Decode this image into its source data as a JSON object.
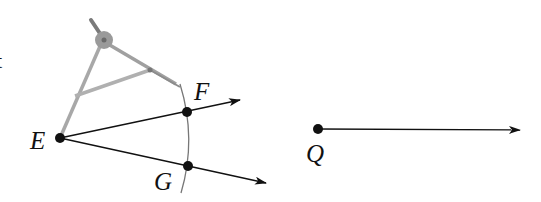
{
  "diagram": {
    "type": "geometric-construction",
    "colors": {
      "ink": "#111111",
      "compass": "#9a9a9a",
      "compass_dark": "#7a7a7a",
      "arc": "#777777"
    },
    "fragment_text": "t",
    "points": {
      "E": {
        "label": "E",
        "x": 60,
        "y": 138
      },
      "F": {
        "label": "F",
        "x": 187,
        "y": 112
      },
      "G": {
        "label": "G",
        "x": 188,
        "y": 166
      },
      "Q": {
        "label": "Q",
        "x": 318,
        "y": 129
      }
    },
    "rays": [
      {
        "from": "E",
        "through": "F",
        "tip": [
          240,
          100
        ]
      },
      {
        "from": "E",
        "through": "G",
        "tip": [
          266,
          183
        ]
      },
      {
        "from": "Q",
        "tip": [
          520,
          130
        ]
      }
    ],
    "arc": {
      "start": [
        180,
        84
      ],
      "mid": [
        191,
        139
      ],
      "end": [
        181,
        193
      ]
    },
    "compass": {
      "hinge": [
        104,
        40
      ],
      "handle_top": [
        91,
        20
      ],
      "needle_tip": [
        60,
        138
      ],
      "pencil_tip": [
        180,
        86
      ],
      "crossbar": [
        [
          75,
          96
        ],
        [
          150,
          70
        ]
      ]
    }
  }
}
